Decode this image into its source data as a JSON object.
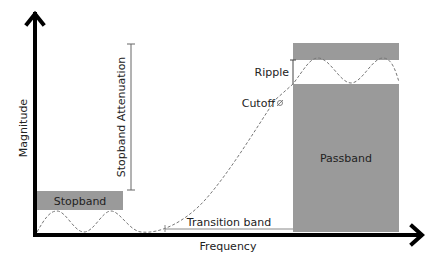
{
  "diagram": {
    "axes": {
      "x_label": "Frequency",
      "y_label": "Magnitude"
    },
    "regions": {
      "stopband": "Stopband",
      "passband": "Passband",
      "transition_band": "Transition band"
    },
    "annotations": {
      "stopband_attenuation": "Stopband Attenuation",
      "ripple": "Ripple",
      "cutoff": "Cutoff"
    },
    "colors": {
      "band_fill": "#9a9a9a",
      "axis": "#000000",
      "curve": "#777777",
      "dimension_line": "#666666"
    }
  }
}
